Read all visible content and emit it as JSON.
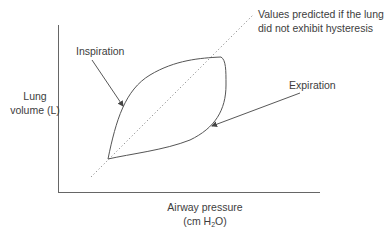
{
  "diagram": {
    "y_axis": {
      "label_line1": "Lung",
      "label_line2": "volume (L)"
    },
    "x_axis": {
      "label_line1": "Airway pressure",
      "label_line2_prefix": "(cm H",
      "label_line2_sub": "2",
      "label_line2_suffix": "O)"
    },
    "annotations": {
      "inspiration": "Inspiration",
      "expiration": "Expiration",
      "no_hysteresis_line1": "Values predicted if the lung",
      "no_hysteresis_line2": "did not exhibit hysteresis"
    },
    "colors": {
      "line": "#555555",
      "dotted": "#8a8a8a",
      "text": "#3d3d3d",
      "background": "#ffffff"
    }
  }
}
